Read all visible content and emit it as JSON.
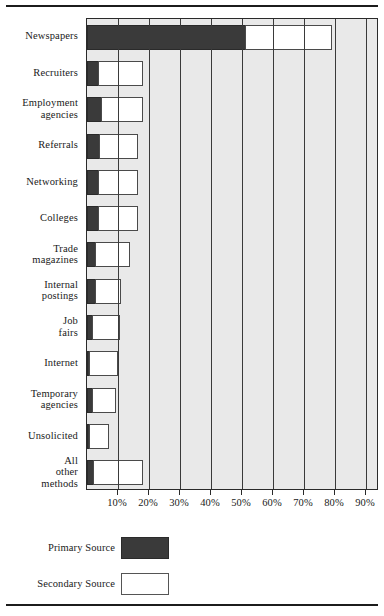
{
  "chart_data": {
    "type": "bar",
    "orientation": "horizontal",
    "stacked": true,
    "title": "",
    "xlabel": "",
    "ylabel": "",
    "xlim": [
      0,
      100
    ],
    "grid": true,
    "legend_position": "below",
    "categories": [
      "Newspapers",
      "Recruiters",
      "Employment agencies",
      "Referrals",
      "Networking",
      "Colleges",
      "Trade magazines",
      "Internal postings",
      "Job fairs",
      "Internet",
      "Temporary agencies",
      "Unsolicited",
      "All other methods"
    ],
    "series": [
      {
        "name": "Primary Source",
        "color": "#3a3a3a",
        "values": [
          51,
          3.5,
          4.5,
          4,
          3.5,
          3.5,
          2.5,
          2.5,
          1.5,
          0.5,
          1.5,
          0.5,
          2
        ]
      },
      {
        "name": "Secondary Source",
        "color": "#ffffff",
        "values": [
          28,
          14.5,
          13.5,
          12.5,
          13,
          13,
          11.5,
          8.5,
          9,
          9.5,
          8,
          6.5,
          16
        ]
      }
    ],
    "xticks": [
      10,
      20,
      30,
      40,
      50,
      60,
      70,
      80,
      90
    ],
    "xticklabels": [
      "10%",
      "20%",
      "30%",
      "40%",
      "50%",
      "60%",
      "70%",
      "80%",
      "90%"
    ]
  },
  "legend": {
    "entries": [
      {
        "label": "Primary Source",
        "swatch": "primary-swatch"
      },
      {
        "label": "Secondary Source",
        "swatch": "secondary-swatch"
      }
    ]
  }
}
